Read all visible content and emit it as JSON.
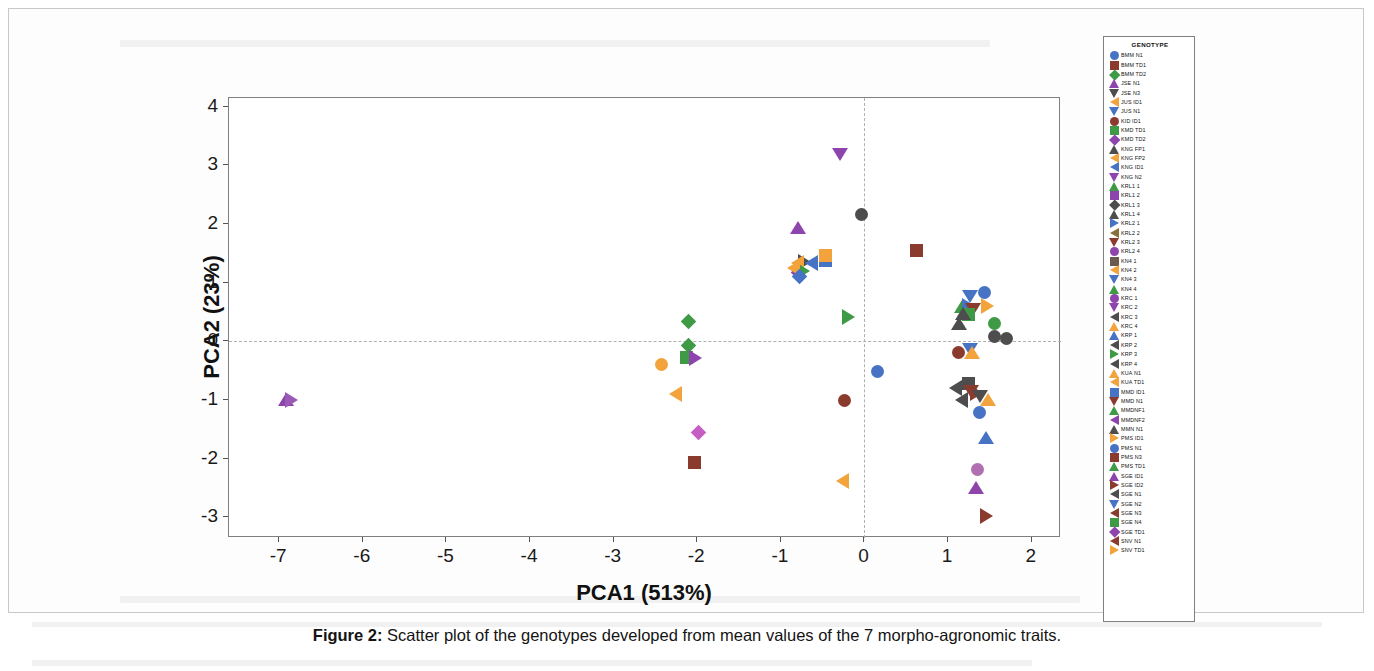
{
  "figure": {
    "caption_label": "Figure 2:",
    "caption_text": " Scatter plot of the genotypes developed from mean values of the 7 morpho-agronomic traits.",
    "legend_title": "GENOTYPE"
  },
  "chart_data": {
    "type": "scatter",
    "title": "",
    "xlabel": "PCA1 (513%)",
    "ylabel": "PCA2 (23%)",
    "xlim": [
      -7.6,
      2.35
    ],
    "ylim": [
      -3.35,
      4.15
    ],
    "xticks": [
      -7,
      -6,
      -5,
      -4,
      -3,
      -2,
      -1,
      0,
      1,
      2
    ],
    "yticks": [
      4,
      3,
      2,
      1,
      0,
      -1,
      -2,
      -3
    ],
    "grid": false,
    "reference_lines": {
      "x": 0,
      "y": 0,
      "style": "dashed"
    },
    "legend_position": "right-outside",
    "legend_entries": [
      {
        "label": "BMM  N1",
        "color": "#4673c4",
        "marker": "circle"
      },
      {
        "label": "BMM  TD1",
        "color": "#8b3a2e",
        "marker": "square"
      },
      {
        "label": "BMM  TD2",
        "color": "#3f9a46",
        "marker": "diamond"
      },
      {
        "label": "JSE  N1",
        "color": "#8e44ad",
        "marker": "triangle-up"
      },
      {
        "label": "JSE  N3",
        "color": "#4d4d4d",
        "marker": "triangle-down"
      },
      {
        "label": "JUS  ID1",
        "color": "#f2a33c",
        "marker": "triangle-left"
      },
      {
        "label": "JUS  N1",
        "color": "#4673c4",
        "marker": "triangle-down"
      },
      {
        "label": "KID  ID1",
        "color": "#8b3a2e",
        "marker": "circle"
      },
      {
        "label": "KMD  TD1",
        "color": "#3f9a46",
        "marker": "square"
      },
      {
        "label": "KMD  TD2",
        "color": "#8e44ad",
        "marker": "diamond"
      },
      {
        "label": "KNG  FP1",
        "color": "#4d4d4d",
        "marker": "triangle-up"
      },
      {
        "label": "KNG  FP2",
        "color": "#f2a33c",
        "marker": "triangle-left"
      },
      {
        "label": "KNG  ID1",
        "color": "#4673c4",
        "marker": "triangle-left"
      },
      {
        "label": "KNG  N2",
        "color": "#8e44ad",
        "marker": "triangle-down"
      },
      {
        "label": "KRL1  1",
        "color": "#3f9a46",
        "marker": "triangle-up"
      },
      {
        "label": "KRL1  2",
        "color": "#8e44ad",
        "marker": "square"
      },
      {
        "label": "KRL1  3",
        "color": "#4d4d4d",
        "marker": "diamond"
      },
      {
        "label": "KRL1  4",
        "color": "#4d4d4d",
        "marker": "triangle-up"
      },
      {
        "label": "KRL2  1",
        "color": "#4673c4",
        "marker": "triangle-right"
      },
      {
        "label": "KRL2  2",
        "color": "#8b6f3a",
        "marker": "triangle-left"
      },
      {
        "label": "KRL2  3",
        "color": "#8b3a2e",
        "marker": "triangle-down"
      },
      {
        "label": "KRL2  4",
        "color": "#8e44ad",
        "marker": "circle"
      },
      {
        "label": "KN4  1",
        "color": "#6b5a4e",
        "marker": "square"
      },
      {
        "label": "KN4  2",
        "color": "#f2a33c",
        "marker": "triangle-left"
      },
      {
        "label": "KN4  3",
        "color": "#4673c4",
        "marker": "triangle-down"
      },
      {
        "label": "KN4  4",
        "color": "#3f9a46",
        "marker": "triangle-up"
      },
      {
        "label": "KRC  1",
        "color": "#8e44ad",
        "marker": "circle"
      },
      {
        "label": "KRC  2",
        "color": "#8e44ad",
        "marker": "triangle-down"
      },
      {
        "label": "KRC  3",
        "color": "#4d4d4d",
        "marker": "triangle-left"
      },
      {
        "label": "KRC  4",
        "color": "#f2a33c",
        "marker": "triangle-up"
      },
      {
        "label": "KRP  1",
        "color": "#4673c4",
        "marker": "triangle-up"
      },
      {
        "label": "KRP  2",
        "color": "#4d4d4d",
        "marker": "triangle-left"
      },
      {
        "label": "KRP  3",
        "color": "#3f9a46",
        "marker": "triangle-right"
      },
      {
        "label": "KRP  4",
        "color": "#4d4d4d",
        "marker": "triangle-left"
      },
      {
        "label": "KUA  N1",
        "color": "#f2a33c",
        "marker": "triangle-up"
      },
      {
        "label": "KUA  TD1",
        "color": "#f2a33c",
        "marker": "triangle-left"
      },
      {
        "label": "MMD  ID1",
        "color": "#4673c4",
        "marker": "square"
      },
      {
        "label": "MMD  N1",
        "color": "#8b3a2e",
        "marker": "triangle-down"
      },
      {
        "label": "MMDNF1",
        "color": "#3f9a46",
        "marker": "triangle-up"
      },
      {
        "label": "MMDNF2",
        "color": "#8e44ad",
        "marker": "triangle-left"
      },
      {
        "label": "MMN  N1",
        "color": "#4d4d4d",
        "marker": "triangle-up"
      },
      {
        "label": "PMS  ID1",
        "color": "#f2a33c",
        "marker": "triangle-right"
      },
      {
        "label": "PMS  N1",
        "color": "#4673c4",
        "marker": "circle"
      },
      {
        "label": "PMS  N3",
        "color": "#8b3a2e",
        "marker": "square"
      },
      {
        "label": "PMS  TD1",
        "color": "#3f9a46",
        "marker": "triangle-up"
      },
      {
        "label": "SGE  ID1",
        "color": "#8e44ad",
        "marker": "triangle-up"
      },
      {
        "label": "SGE  ID2",
        "color": "#8b3a2e",
        "marker": "triangle-right"
      },
      {
        "label": "SGE  N1",
        "color": "#4d4d4d",
        "marker": "triangle-left"
      },
      {
        "label": "SGE  N2",
        "color": "#4673c4",
        "marker": "triangle-down"
      },
      {
        "label": "SGE  N3",
        "color": "#8b3a2e",
        "marker": "triangle-left"
      },
      {
        "label": "SGE  N4",
        "color": "#3f9a46",
        "marker": "square"
      },
      {
        "label": "SGE  TD1",
        "color": "#8e44ad",
        "marker": "diamond"
      },
      {
        "label": "SNV  N1",
        "color": "#8b3a2e",
        "marker": "triangle-left"
      },
      {
        "label": "SNV  TD1",
        "color": "#f2a33c",
        "marker": "triangle-right"
      }
    ],
    "points": [
      {
        "label": "JSE  N1",
        "x": -6.92,
        "y": -0.99,
        "color": "#8e44ad",
        "marker": "triangle-up"
      },
      {
        "label": "JSE  N3",
        "x": -6.86,
        "y": -1.0,
        "color": "#9b59b6",
        "marker": "triangle-right"
      },
      {
        "label": "BMM  TD2",
        "x": -2.11,
        "y": 0.34,
        "color": "#3f9a46",
        "marker": "diamond"
      },
      {
        "label": "KMD  TD1",
        "x": -2.1,
        "y": -0.07,
        "color": "#3f9a46",
        "marker": "diamond"
      },
      {
        "label": "KMD  TD2",
        "x": -2.13,
        "y": -0.27,
        "color": "#3f9a46",
        "marker": "square"
      },
      {
        "label": "SGE  TD1",
        "x": -2.03,
        "y": -0.29,
        "color": "#8e44ad",
        "marker": "triangle-right"
      },
      {
        "label": "JUS  ID1",
        "x": -2.43,
        "y": -0.39,
        "color": "#f2a33c",
        "marker": "circle"
      },
      {
        "label": "KUA  TD1",
        "x": -2.25,
        "y": -0.89,
        "color": "#f2a33c",
        "marker": "triangle-left"
      },
      {
        "label": "MMDNF2",
        "x": -1.99,
        "y": -1.56,
        "color": "#c45ec4",
        "marker": "diamond"
      },
      {
        "label": "PMS  N3",
        "x": -2.03,
        "y": -2.07,
        "color": "#8b3a2e",
        "marker": "square"
      },
      {
        "label": "KNG  N2",
        "x": -0.29,
        "y": 3.2,
        "color": "#8e44ad",
        "marker": "triangle-down"
      },
      {
        "label": "MMN  N1",
        "x": -0.04,
        "y": 2.17,
        "color": "#4d4d4d",
        "marker": "circle"
      },
      {
        "label": "SGE  ID1",
        "x": -0.79,
        "y": 1.93,
        "color": "#8e44ad",
        "marker": "triangle-up"
      },
      {
        "label": "KRL2  1",
        "x": -0.72,
        "y": 1.36,
        "color": "#4d4d4d",
        "marker": "triangle-right"
      },
      {
        "label": "KRL1  1",
        "x": -0.8,
        "y": 1.33,
        "color": "#f2a33c",
        "marker": "triangle-left"
      },
      {
        "label": "KRC  3",
        "x": -0.63,
        "y": 1.33,
        "color": "#4673c4",
        "marker": "triangle-left"
      },
      {
        "label": "MMD  ID1",
        "x": -0.47,
        "y": 1.38,
        "color": "#4673c4",
        "marker": "square"
      },
      {
        "label": "KN4  2",
        "x": -0.47,
        "y": 1.47,
        "color": "#f2a33c",
        "marker": "square"
      },
      {
        "label": "KRL1  2",
        "x": -0.79,
        "y": 1.18,
        "color": "#8e44ad",
        "marker": "diamond"
      },
      {
        "label": "KRP  3",
        "x": -0.73,
        "y": 1.2,
        "color": "#3f9a46",
        "marker": "triangle-right"
      },
      {
        "label": "KRL2  2",
        "x": -0.84,
        "y": 1.26,
        "color": "#f2a33c",
        "marker": "triangle-left"
      },
      {
        "label": "KRL1  3",
        "x": -0.78,
        "y": 1.11,
        "color": "#4673c4",
        "marker": "diamond"
      },
      {
        "label": "BMM  TD1",
        "x": 0.62,
        "y": 1.55,
        "color": "#8b3a2e",
        "marker": "square"
      },
      {
        "label": "MMDNF1",
        "x": -0.2,
        "y": 0.42,
        "color": "#3f9a46",
        "marker": "triangle-right"
      },
      {
        "label": "KID  ID1",
        "x": -0.24,
        "y": -1.01,
        "color": "#8b3a2e",
        "marker": "circle"
      },
      {
        "label": "PMS  N1",
        "x": 0.16,
        "y": -0.52,
        "color": "#4673c4",
        "marker": "circle"
      },
      {
        "label": "PMS  ID1",
        "x": -0.26,
        "y": -2.38,
        "color": "#f2a33c",
        "marker": "triangle-left"
      },
      {
        "label": "JUS  N1",
        "x": 1.26,
        "y": 0.78,
        "color": "#4673c4",
        "marker": "triangle-down"
      },
      {
        "label": "KN4  4",
        "x": 1.17,
        "y": 0.58,
        "color": "#3f9a46",
        "marker": "triangle-up"
      },
      {
        "label": "KRP  1",
        "x": 1.24,
        "y": 0.6,
        "color": "#4673c4",
        "marker": "triangle-right"
      },
      {
        "label": "KRL2  3",
        "x": 1.3,
        "y": 0.55,
        "color": "#8b3a2e",
        "marker": "triangle-down"
      },
      {
        "label": "SGE  N4",
        "x": 1.24,
        "y": 0.46,
        "color": "#3f9a46",
        "marker": "square"
      },
      {
        "label": "KNG  FP1",
        "x": 1.18,
        "y": 0.47,
        "color": "#4d4d4d",
        "marker": "triangle-up"
      },
      {
        "label": "KRC  4",
        "x": 1.46,
        "y": 0.6,
        "color": "#f2a33c",
        "marker": "triangle-right"
      },
      {
        "label": "KNG  FP2",
        "x": 1.13,
        "y": 0.29,
        "color": "#4d4d4d",
        "marker": "triangle-up"
      },
      {
        "label": "KRL1  4",
        "x": 1.55,
        "y": 0.3,
        "color": "#3f9a46",
        "marker": "circle"
      },
      {
        "label": "KRC  1",
        "x": 1.56,
        "y": 0.08,
        "color": "#4d4d4d",
        "marker": "circle"
      },
      {
        "label": "SNV  N1",
        "x": 1.7,
        "y": 0.05,
        "color": "#4d4d4d",
        "marker": "circle"
      },
      {
        "label": "SGE  N3",
        "x": 1.12,
        "y": -0.19,
        "color": "#8b3a2e",
        "marker": "circle"
      },
      {
        "label": "SGE  N2",
        "x": 1.26,
        "y": -0.13,
        "color": "#4673c4",
        "marker": "triangle-down"
      },
      {
        "label": "KUA  N1",
        "x": 1.28,
        "y": -0.2,
        "color": "#f2a33c",
        "marker": "triangle-up"
      },
      {
        "label": "BMM  N1",
        "x": 1.44,
        "y": 0.83,
        "color": "#4673c4",
        "marker": "circle"
      },
      {
        "label": "KN4  1",
        "x": 1.24,
        "y": -0.72,
        "color": "#4d4d4d",
        "marker": "square"
      },
      {
        "label": "MMD  N1",
        "x": 1.27,
        "y": -0.85,
        "color": "#8b3a2e",
        "marker": "triangle-down"
      },
      {
        "label": "KRL2  4",
        "x": 1.33,
        "y": -0.87,
        "color": "#8b3a2e",
        "marker": "triangle-right"
      },
      {
        "label": "SGE  N1",
        "x": 1.38,
        "y": -0.93,
        "color": "#4d4d4d",
        "marker": "triangle-down"
      },
      {
        "label": "KRP  2",
        "x": 1.09,
        "y": -0.8,
        "color": "#4d4d4d",
        "marker": "triangle-left"
      },
      {
        "label": "KRP  4",
        "x": 1.17,
        "y": -1.0,
        "color": "#4d4d4d",
        "marker": "triangle-left"
      },
      {
        "label": "SNV  TD1",
        "x": 1.48,
        "y": -1.0,
        "color": "#f2a33c",
        "marker": "triangle-up"
      },
      {
        "label": "PMS  TD1",
        "x": 1.38,
        "y": -1.21,
        "color": "#4673c4",
        "marker": "circle"
      },
      {
        "label": "KRC  2",
        "x": 1.35,
        "y": -2.19,
        "color": "#b06fb0",
        "marker": "circle"
      },
      {
        "label": "KNG  ID1",
        "x": 1.33,
        "y": -2.49,
        "color": "#8e44ad",
        "marker": "triangle-up"
      },
      {
        "label": "SGE  ID2",
        "x": 1.45,
        "y": -2.98,
        "color": "#8b3a2e",
        "marker": "triangle-right"
      },
      {
        "label": "MMD  ID1b",
        "x": 1.45,
        "y": -1.64,
        "color": "#4673c4",
        "marker": "triangle-up"
      }
    ]
  }
}
